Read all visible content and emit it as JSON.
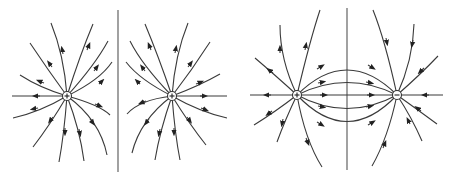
{
  "figure": {
    "colors": {
      "line": "#3a3a3a",
      "background": "#ffffff"
    },
    "panels": [
      {
        "id": "like-charges",
        "title": "Two positive charges (separated by symmetry plane)",
        "charges": [
          {
            "sign": "+",
            "x": 67,
            "y": 96
          },
          {
            "sign": "+",
            "x": 172,
            "y": 96
          }
        ],
        "divider": {
          "x": 118,
          "y1": 10,
          "y2": 172
        }
      },
      {
        "id": "opposite-charges",
        "title": "Positive and negative charge (dipole)",
        "charges": [
          {
            "sign": "+",
            "x": 297,
            "y": 95
          },
          {
            "sign": "−",
            "x": 397,
            "y": 95
          }
        ],
        "divider": {
          "x": 347,
          "y1": 8,
          "y2": 170
        }
      }
    ]
  }
}
